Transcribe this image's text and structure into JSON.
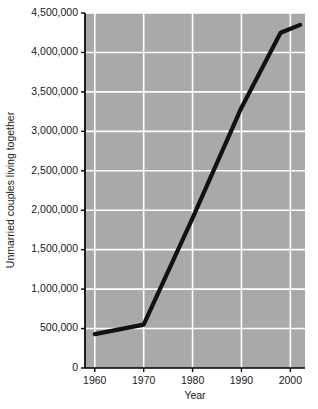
{
  "chart_data": {
    "type": "line",
    "title": "",
    "xlabel": "Year",
    "ylabel": "Unmarried couples living together",
    "xlim": [
      1958,
      2003
    ],
    "ylim": [
      0,
      4500000
    ],
    "grid": true,
    "legend": "none",
    "x_ticks": [
      1960,
      1970,
      1980,
      1990,
      2000
    ],
    "x_tick_labels": [
      "1960",
      "1970",
      "1980",
      "1990",
      "2000"
    ],
    "y_ticks": [
      0,
      500000,
      1000000,
      1500000,
      2000000,
      2500000,
      3000000,
      3500000,
      4000000,
      4500000
    ],
    "y_tick_labels": [
      "0",
      "500,000",
      "1,000,000",
      "1,500,000",
      "2,000,000",
      "2,500,000",
      "3,000,000",
      "3,500,000",
      "4,000,000",
      "4,500,000"
    ],
    "series": [
      {
        "name": "Unmarried couples living together",
        "color": "#111111",
        "x": [
          1960,
          1970,
          1980,
          1990,
          1998,
          2002
        ],
        "values": [
          430000,
          550000,
          1900000,
          3300000,
          4250000,
          4350000
        ]
      }
    ]
  },
  "style": {
    "plot_background": "#a9a9a9",
    "gridline_color": "#ffffff",
    "axis_color": "#000000",
    "page_background": "#ffffff"
  }
}
